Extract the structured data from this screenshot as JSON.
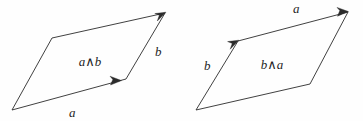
{
  "figure": {
    "background_color": "#fefefe",
    "stroke_color": "#2b2b2b",
    "text_color": "#1f1f1f",
    "panels": [
      {
        "id": "left-panel",
        "name": "a-wedge-b-parallelogram",
        "area_label": "a∧b",
        "area_label_pos": [
          90,
          66
        ],
        "vertices": {
          "bottom_left": [
            12,
            110
          ],
          "top_left": [
            52,
            38
          ],
          "top_right": [
            165,
            13
          ],
          "bottom_right": [
            126,
            79
          ]
        },
        "vectors": [
          {
            "name": "a",
            "label": "a",
            "label_pos": [
              69,
              117
            ],
            "from": [
              12,
              110
            ],
            "to": [
              126,
              79
            ],
            "arrow_at": [
              120,
              81
            ],
            "arrow_angle_deg": -15.2,
            "description": "bottom edge pointing right and slightly up"
          },
          {
            "name": "b",
            "label": "b",
            "label_pos": [
              155,
              56
            ],
            "from": [
              126,
              79
            ],
            "to": [
              165,
              13
            ],
            "arrow_at": [
              165,
              13
            ],
            "arrow_angle_deg": -59.4,
            "description": "right edge pointing up and right"
          }
        ],
        "orientation": "counter-clockwise"
      },
      {
        "id": "right-panel",
        "name": "b-wedge-a-parallelogram",
        "area_label": "b∧a",
        "area_label_pos": [
          272,
          69
        ],
        "vertices": {
          "bottom_left": [
            196,
            110
          ],
          "top_left": [
            238,
            41
          ],
          "top_right": [
            348,
            12
          ],
          "bottom_right": [
            310,
            84
          ]
        },
        "vectors": [
          {
            "name": "b",
            "label": "b",
            "label_pos": [
              204,
              70
            ],
            "from": [
              196,
              110
            ],
            "to": [
              238,
              41
            ],
            "arrow_at": [
              238,
              41
            ],
            "arrow_angle_deg": -58.7,
            "description": "left edge pointing up and right"
          },
          {
            "name": "a",
            "label": "a",
            "label_pos": [
              293,
              13
            ],
            "from": [
              238,
              41
            ],
            "to": [
              348,
              12
            ],
            "arrow_at": [
              346,
              13
            ],
            "arrow_angle_deg": -14.8,
            "description": "top edge pointing right and slightly up"
          }
        ],
        "orientation": "clockwise"
      }
    ]
  }
}
